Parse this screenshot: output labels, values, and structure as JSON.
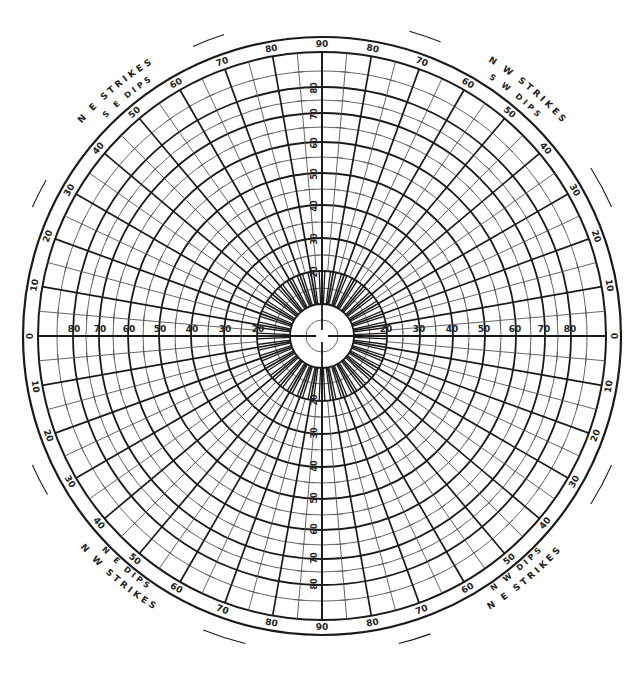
{
  "diagram": {
    "type": "polar-stereonet",
    "center": [
      322,
      336
    ],
    "outer_radius": 299,
    "net_radius": 284,
    "colors": {
      "ink": "#1a1a1a",
      "light_ink": "#555555",
      "background": "#ffffff"
    },
    "ring_values": [
      10,
      20,
      30,
      40,
      50,
      60,
      70,
      80
    ],
    "ring_radii": {
      "5": 16,
      "10": 32,
      "15": 48,
      "20": 65,
      "25": 81,
      "30": 98,
      "35": 114,
      "40": 131,
      "45": 147,
      "50": 163,
      "55": 179,
      "60": 194,
      "65": 209,
      "70": 223,
      "75": 236,
      "80": 249,
      "85": 265,
      "90": 284
    },
    "axis_labels": {
      "west": [
        "80",
        "70",
        "60",
        "50",
        "40",
        "30",
        "20"
      ],
      "east": [
        "20",
        "30",
        "40",
        "50",
        "60",
        "70",
        "80"
      ],
      "north": [
        "20",
        "30",
        "40",
        "50",
        "60",
        "70",
        "80"
      ],
      "south": [
        "20",
        "30",
        "40",
        "50",
        "60",
        "70",
        "80"
      ]
    },
    "perimeter_labels": {
      "top": [
        "90",
        "80",
        "70",
        "60",
        "50",
        "40",
        "30",
        "20",
        "10",
        "0"
      ],
      "values_per_quadrant": [
        0,
        10,
        20,
        30,
        40,
        50,
        60,
        70,
        80,
        90
      ]
    },
    "corner_labels": {
      "top_left": {
        "strikes": "N E  STRIKES",
        "dips": "S E  DIPS"
      },
      "top_right": {
        "strikes": "N W  STRIKES",
        "dips": "S W  DIPS"
      },
      "bottom_left": {
        "strikes": "N W  STRIKES",
        "dips": "N E  DIPS"
      },
      "bottom_right": {
        "strikes": "N E  STRIKES",
        "dips": "N W  DIPS"
      }
    }
  }
}
